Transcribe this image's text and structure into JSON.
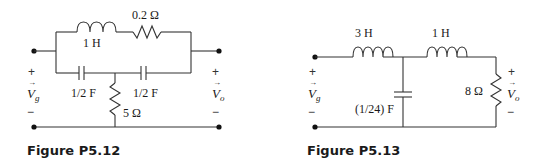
{
  "figures": [
    {
      "caption": "Figure P5.12",
      "components": {
        "inductor": "1 H",
        "series_resistor": "0.2 Ω",
        "capacitor_left": "1/2 F",
        "capacitor_right": "1/2 F",
        "shunt_resistor": "5 Ω"
      },
      "input": {
        "symbol": "V",
        "sub": "g",
        "plus": "+",
        "minus": "−"
      },
      "output": {
        "symbol": "V",
        "sub": "o",
        "plus": "+",
        "minus": "−"
      }
    },
    {
      "caption": "Figure P5.13",
      "components": {
        "inductor_left": "3 H",
        "inductor_right": "1 H",
        "capacitor": "(1/24) F",
        "load_resistor": "8 Ω"
      },
      "input": {
        "symbol": "V",
        "sub": "g",
        "plus": "+",
        "minus": "−"
      },
      "output": {
        "symbol": "V",
        "sub": "o",
        "plus": "+",
        "minus": "−"
      }
    }
  ]
}
